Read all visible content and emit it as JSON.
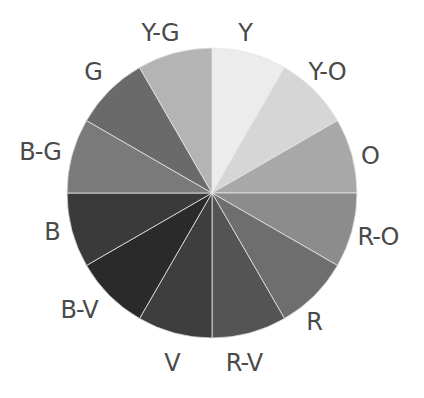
{
  "diagram": {
    "type": "color-wheel",
    "center": [
      212,
      193
    ],
    "radius": 145,
    "segments": [
      {
        "label": "Y",
        "start": 0,
        "end": 30,
        "fill": "#ececec",
        "lx": 245,
        "ly": 33
      },
      {
        "label": "Y-O",
        "start": 30,
        "end": 60,
        "fill": "#d6d6d6",
        "lx": 327,
        "ly": 72
      },
      {
        "label": "O",
        "start": 60,
        "end": 90,
        "fill": "#a8a8a8",
        "lx": 370,
        "ly": 156
      },
      {
        "label": "R-O",
        "start": 90,
        "end": 120,
        "fill": "#8c8c8c",
        "lx": 378,
        "ly": 237
      },
      {
        "label": "R",
        "start": 120,
        "end": 150,
        "fill": "#6e6e6e",
        "lx": 314,
        "ly": 322
      },
      {
        "label": "R-V",
        "start": 150,
        "end": 180,
        "fill": "#545454",
        "lx": 244,
        "ly": 363
      },
      {
        "label": "V",
        "start": 180,
        "end": 210,
        "fill": "#3e3e3e",
        "lx": 172,
        "ly": 363
      },
      {
        "label": "B-V",
        "start": 210,
        "end": 240,
        "fill": "#2a2a2a",
        "lx": 79,
        "ly": 310
      },
      {
        "label": "B",
        "start": 240,
        "end": 270,
        "fill": "#3a3a3a",
        "lx": 52,
        "ly": 232
      },
      {
        "label": "B-G",
        "start": 270,
        "end": 300,
        "fill": "#7a7a7a",
        "lx": 40,
        "ly": 152
      },
      {
        "label": "G",
        "start": 300,
        "end": 330,
        "fill": "#6a6a6a",
        "lx": 93,
        "ly": 72
      },
      {
        "label": "Y-G",
        "start": 330,
        "end": 360,
        "fill": "#b4b4b4",
        "lx": 160,
        "ly": 33
      }
    ]
  }
}
